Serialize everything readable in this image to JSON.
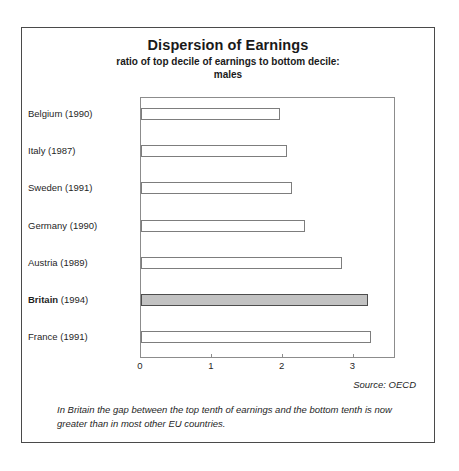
{
  "chart_data": {
    "type": "bar",
    "orientation": "horizontal",
    "title": "Dispersion of Earnings",
    "subtitle": "ratio of top decile of earnings to bottom decile:\nmales",
    "subtitle_line1": "ratio of top decile of earnings to bottom decile:",
    "subtitle_line2": "males",
    "xlabel": "",
    "ylabel": "",
    "xlim": [
      0,
      3.6
    ],
    "xticks": [
      0,
      1,
      2,
      3
    ],
    "xtick_labels": [
      "0",
      "1",
      "2",
      "3"
    ],
    "grid": false,
    "legend": false,
    "categories": [
      "Belgium (1990)",
      "Italy (1987)",
      "Sweden (1991)",
      "Germany (1990)",
      "Austria (1989)",
      "Britain (1994)",
      "France (1991)"
    ],
    "values": [
      1.96,
      2.06,
      2.13,
      2.32,
      2.84,
      3.2,
      3.24
    ],
    "bars": [
      {
        "country": "Belgium",
        "year": "(1990)",
        "value": 1.96,
        "highlight": false
      },
      {
        "country": "Italy",
        "year": "(1987)",
        "value": 2.06,
        "highlight": false
      },
      {
        "country": "Sweden",
        "year": "(1991)",
        "value": 2.13,
        "highlight": false
      },
      {
        "country": "Germany",
        "year": "(1990)",
        "value": 2.32,
        "highlight": false
      },
      {
        "country": "Austria",
        "year": "(1989)",
        "value": 2.84,
        "highlight": false
      },
      {
        "country": "Britain",
        "year": "(1994)",
        "value": 3.2,
        "highlight": true
      },
      {
        "country": "France",
        "year": "(1991)",
        "value": 3.24,
        "highlight": false
      }
    ],
    "highlight_category": "Britain (1994)",
    "colors": {
      "bar_fill": "#ffffff",
      "bar_border": "#7d7d7d",
      "highlight_fill": "#c2c2c2",
      "highlight_border": "#4d4d4d",
      "axis": "#8c8c8c",
      "frame": "#4a4a4a",
      "text": "#1f1f1f"
    },
    "source": "Source: OECD",
    "annotation": "In Britain the gap between the top tenth of earnings and the bottom tenth is now greater than in most other EU countries."
  }
}
